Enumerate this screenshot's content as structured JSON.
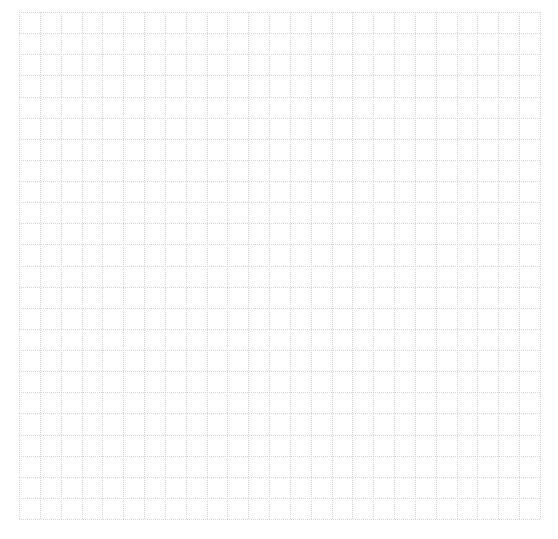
{
  "canvas": {
    "background": "#ffffff",
    "line_color": "#d4d4d4",
    "columns": 25,
    "rows": 24,
    "left": 19,
    "top": 12,
    "width": 521,
    "height": 507,
    "dash": "1,1"
  }
}
